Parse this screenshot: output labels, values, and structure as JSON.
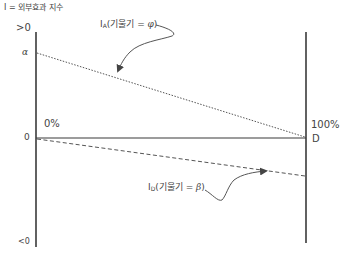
{
  "title": "I = 외부효과 지수",
  "y_axis": {
    "top_label": ">0",
    "alpha_label": "α",
    "zero_label": "0",
    "bottom_label": "<0"
  },
  "x_axis": {
    "left_label": "0%",
    "right_label": "100%",
    "end_point_label": "D"
  },
  "curves": {
    "IA": {
      "name_main": "I",
      "name_sub": "A",
      "desc_prefix": "(기울기 = ",
      "slope_symbol": "φ",
      "desc_suffix": ")",
      "style": "dotted"
    },
    "ID": {
      "name_main": "I",
      "name_sub": "D",
      "desc_prefix": "(기울기 = ",
      "slope_symbol": "β",
      "desc_suffix": ")",
      "style": "dashed"
    }
  },
  "colors": {
    "axis": "#3a3a3a",
    "line": "#555555",
    "text": "#444444"
  }
}
